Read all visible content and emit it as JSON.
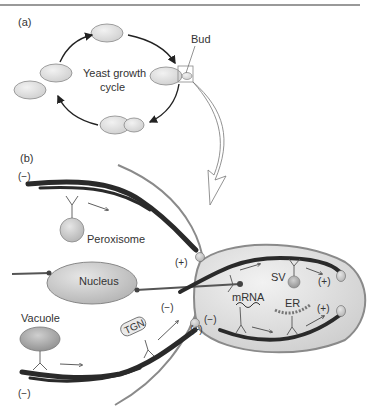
{
  "figure": {
    "panels": [
      {
        "id": "a",
        "label": "(a)"
      },
      {
        "id": "b",
        "label": "(b)"
      }
    ],
    "panel_a": {
      "title": "Yeast growth cycle",
      "title_line1": "Yeast growth",
      "title_line2": "cycle",
      "bud_label": "Bud"
    },
    "panel_b": {
      "labels": {
        "peroxisome": "Peroxisome",
        "nucleus": "Nucleus",
        "vacuole": "Vacuole",
        "tgn": "TGN",
        "sv": "SV",
        "mrna": "mRNA",
        "er": "ER"
      },
      "polarity": {
        "minus": "(−)",
        "plus": "(+)"
      }
    },
    "colors": {
      "cell_fill": "#dcdcdc",
      "cell_outline": "#8a8a8a",
      "actin": "#2a2a2a",
      "organelle_fill": "#c8c8c8",
      "text": "#333333"
    }
  }
}
